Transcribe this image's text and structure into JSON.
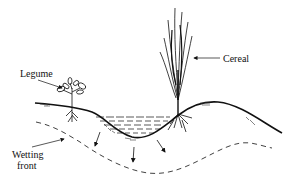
{
  "diagram": {
    "type": "soil-cross-section",
    "labels": {
      "legume": "Legume",
      "cereal": "Cereal",
      "wetting_front_line1": "Wetting",
      "wetting_front_line2": "front"
    },
    "elements": [
      "legume-plant",
      "cereal-plant",
      "ground-surface",
      "ponded-water",
      "infiltration-arrows",
      "wetting-front"
    ],
    "colors": {
      "ink": "#111111",
      "background": "#ffffff"
    }
  }
}
